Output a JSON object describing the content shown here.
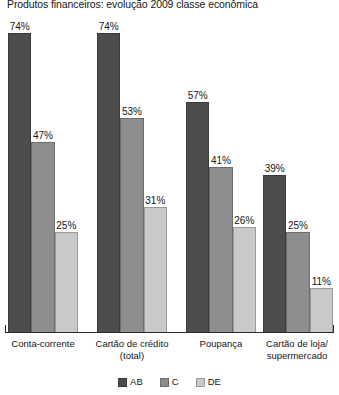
{
  "chart_data": {
    "type": "bar",
    "title": "Produtos financeiros: evolução 2009 classe econômica",
    "xlabel": "",
    "ylabel": "",
    "ylim": [
      0,
      80
    ],
    "grid": false,
    "legend_position": "bottom-center",
    "value_suffix": "%",
    "categories": [
      "Conta-corrente",
      "Cartão de crédito (total)",
      "Poupança",
      "Cartão de loja/ supermercado"
    ],
    "category_lines": [
      [
        "Conta-corrente"
      ],
      [
        "Cartão de crédito",
        "(total)"
      ],
      [
        "Poupança"
      ],
      [
        "Cartão de loja/",
        "supermercado"
      ]
    ],
    "series": [
      {
        "name": "AB",
        "color": "#4d4d4d",
        "values": [
          74,
          74,
          57,
          39
        ]
      },
      {
        "name": "C",
        "color": "#8e8e8e",
        "values": [
          47,
          53,
          41,
          25
        ]
      },
      {
        "name": "DE",
        "color": "#c9c9c9",
        "values": [
          25,
          31,
          26,
          11
        ]
      }
    ],
    "data_labels": [
      [
        "74%",
        "47%",
        "25%"
      ],
      [
        "74%",
        "53%",
        "31%"
      ],
      [
        "57%",
        "41%",
        "26%"
      ],
      [
        "39%",
        "25%",
        "11%"
      ]
    ],
    "legend": [
      {
        "label": "AB",
        "color": "#4d4d4d"
      },
      {
        "label": "C",
        "color": "#8e8e8e"
      },
      {
        "label": "DE",
        "color": "#c9c9c9"
      }
    ]
  },
  "layout": {
    "groups_px": [
      {
        "left": 8,
        "width": 70,
        "label_left": 0,
        "label_width": 86
      },
      {
        "left": 97,
        "width": 70,
        "label_left": 89,
        "label_width": 86
      },
      {
        "left": 186,
        "width": 70,
        "label_left": 178,
        "label_width": 86
      },
      {
        "left": 263,
        "width": 70,
        "label_left": 255,
        "label_width": 84
      }
    ],
    "value_scale_px_per_unit": 4.06,
    "plot_height_px": 319
  }
}
